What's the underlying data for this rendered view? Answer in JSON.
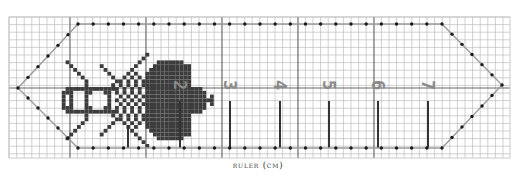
{
  "caption": "ruler (cm)",
  "grid": {
    "x0": 9,
    "y0": 17,
    "x1": 510,
    "y1": 158,
    "cell": 7.6,
    "major_every": 10,
    "minor_color": "#bdbdbd",
    "major_color": "#555555",
    "major_x": [
      70,
      146,
      222,
      298,
      374
    ],
    "major_y": [
      88
    ]
  },
  "outline": {
    "color": "#9a9a9a",
    "dot_color": "#1a1a1a",
    "points": [
      [
        18,
        88
      ],
      [
        78,
        24
      ],
      [
        442,
        24
      ],
      [
        502,
        85
      ],
      [
        442,
        148
      ],
      [
        78,
        148
      ]
    ],
    "dot_spacing": 15.2
  },
  "ticks": {
    "color": "#333333",
    "bottom_y": 148,
    "items": [
      {
        "x": 128,
        "top": 125
      },
      {
        "x": 180,
        "top": 101
      },
      {
        "x": 230,
        "top": 101
      },
      {
        "x": 280,
        "top": 101
      },
      {
        "x": 329,
        "top": 101
      },
      {
        "x": 378,
        "top": 101
      },
      {
        "x": 428,
        "top": 101
      }
    ]
  },
  "numerals": {
    "color": "#8a8a8a",
    "labels": [
      "2",
      "3",
      "4",
      "5",
      "6",
      "7"
    ],
    "centers_x": [
      180,
      230,
      280,
      329,
      378,
      428
    ],
    "center_y": 85
  },
  "bee": {
    "color": "#3c3c3c",
    "description": "cross-stitch bee motif, head left, wings spread"
  }
}
